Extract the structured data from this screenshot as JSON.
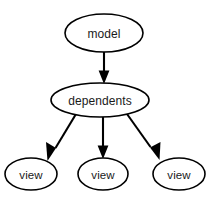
{
  "diagram": {
    "type": "directed-graph",
    "canvas": {
      "width": 214,
      "height": 202,
      "background": "#ffffff"
    },
    "style": {
      "node_fill": "#ffffff",
      "node_stroke": "#000000",
      "edge_color": "#000000",
      "text_color": "#1a1a1a"
    },
    "nodes": [
      {
        "id": "model",
        "label": "model",
        "shape": "ellipse",
        "cx": 104,
        "cy": 33,
        "rx": 39,
        "ry": 19
      },
      {
        "id": "dependents",
        "label": "dependents",
        "shape": "ellipse",
        "cx": 100,
        "cy": 100,
        "rx": 49,
        "ry": 17
      },
      {
        "id": "view-left",
        "label": "view",
        "shape": "ellipse",
        "cx": 31,
        "cy": 174,
        "rx": 26,
        "ry": 16
      },
      {
        "id": "view-center",
        "label": "view",
        "shape": "ellipse",
        "cx": 103,
        "cy": 174,
        "rx": 25,
        "ry": 16
      },
      {
        "id": "view-right",
        "label": "view",
        "shape": "ellipse",
        "cx": 179,
        "cy": 174,
        "rx": 26,
        "ry": 16
      }
    ],
    "edges": [
      {
        "id": "model-to-dependents",
        "from": "model",
        "to": "view",
        "source": "model",
        "target": "dependents",
        "arrow": "triangle"
      },
      {
        "id": "dependents-to-view-left",
        "from": "dependents",
        "to": "view-left",
        "source": "dependents",
        "target": "view-left",
        "arrow": "triangle"
      },
      {
        "id": "dependents-to-view-center",
        "from": "dependents",
        "to": "view-center",
        "source": "dependents",
        "target": "view-center",
        "arrow": "triangle"
      },
      {
        "id": "dependents-to-view-right",
        "from": "dependents",
        "to": "view-right",
        "source": "dependents",
        "target": "view-right",
        "arrow": "triangle"
      }
    ]
  }
}
